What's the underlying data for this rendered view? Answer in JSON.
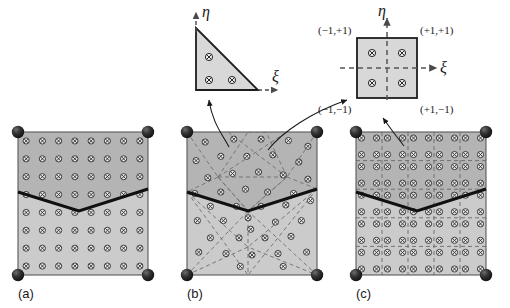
{
  "figure": {
    "type": "fem-mesh-diagram",
    "width": 510,
    "height": 308
  },
  "colors": {
    "upper_material_fill": "#b4b4b4",
    "lower_material_fill": "#cccccc",
    "reference_fill": "#d8d8d8",
    "outline": "#555555",
    "interface_line": "#111111",
    "mesh_dashed": "#6e6e6e",
    "node_fill": "#2b2b2b",
    "gauss_point": "#333333",
    "background": "#ffffff"
  },
  "panels": [
    {
      "id": "a",
      "label": "(a)",
      "mesh_type": "single element with dense integration grid",
      "x": 18,
      "y": 132,
      "w": 130,
      "h": 143,
      "gauss_grid": {
        "cols": 8,
        "rows": 8
      },
      "corner_nodes": 4,
      "element_lines_visible": false
    },
    {
      "id": "b",
      "label": "(b)",
      "mesh_type": "unstructured triangular mesh",
      "x": 187,
      "y": 132,
      "w": 130,
      "h": 143,
      "corner_nodes": 4,
      "element_lines_visible": true,
      "element_line_style": "dashed"
    },
    {
      "id": "c",
      "label": "(c)",
      "mesh_type": "structured quadrilateral mesh",
      "x": 356,
      "y": 132,
      "w": 130,
      "h": 143,
      "quad_grid": {
        "cols": 5,
        "rows": 5
      },
      "gauss_per_element": 4,
      "corner_nodes": 4,
      "element_lines_visible": true,
      "element_line_style": "dashed"
    }
  ],
  "interface": {
    "shape": "v-notch",
    "left_y_frac": 0.42,
    "vertex_x_frac": 0.47,
    "vertex_y_frac": 0.55,
    "right_y_frac": 0.4,
    "stroke_width": 3
  },
  "reference_elements": [
    {
      "id": "triangle",
      "name": "triangular-reference-element",
      "x": 196,
      "y": 28,
      "size": 62,
      "gauss_points": 3,
      "axis_xi": "ξ",
      "axis_eta": "η"
    },
    {
      "id": "square",
      "name": "quadrilateral-reference-element",
      "x": 357,
      "y": 38,
      "size": 60,
      "gauss_points": 4,
      "axis_xi": "ξ",
      "axis_eta": "η",
      "corner_coords": {
        "top_left": "(−1,+1)",
        "top_right": "(+1,+1)",
        "bottom_left": "(−1,−1)",
        "bottom_right": "(+1,−1)"
      }
    }
  ],
  "leader_arrows": [
    {
      "name": "arrow-b-to-triangle",
      "from": "panel-b",
      "to": "triangle-reference-element"
    },
    {
      "name": "arrow-b-to-square",
      "from": "panel-b",
      "to": "square-reference-element"
    },
    {
      "name": "arrow-c-to-square",
      "from": "panel-c",
      "to": "square-reference-element"
    }
  ],
  "symbols": {
    "gauss_point_glyph": "circle-with-x",
    "node_glyph": "filled-sphere"
  }
}
